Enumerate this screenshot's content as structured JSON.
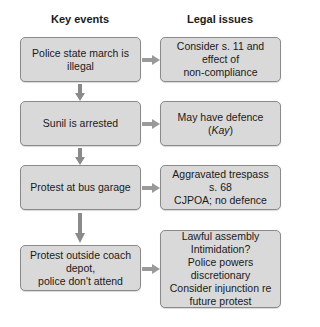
{
  "headers": {
    "left": "Key events",
    "right": "Legal issues"
  },
  "rows": [
    {
      "event": "Police state march is illegal",
      "issue": [
        "Consider s. 11 and effect of",
        "non-compliance"
      ]
    },
    {
      "event": "Sunil is arrested",
      "issue_pre": "May have defence (",
      "issue_italic": "Kay",
      "issue_post": ")"
    },
    {
      "event": "Protest at bus garage",
      "issue": [
        "Aggravated trespass s. 68",
        "CJPOA; no defence"
      ]
    },
    {
      "event": [
        "Protest outside coach depot,",
        "police don't attend"
      ],
      "issue": [
        "Lawful assembly",
        "Intimidation?",
        "Police powers",
        "discretionary",
        "Consider injunction re",
        "future protest"
      ]
    }
  ],
  "colors": {
    "box_fill": "#d9d9d9",
    "box_border": "#8a8a8a",
    "arrow": "#9a9a9a"
  }
}
